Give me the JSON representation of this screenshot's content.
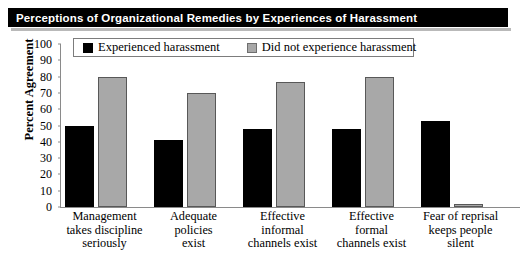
{
  "title": "Perceptions of Organizational Remedies by Experiences of Harassment",
  "axis_title": "Percent Agreement",
  "legend": {
    "entries": [
      {
        "label": "Experienced harassment",
        "color": "#000000",
        "swatch": "black"
      },
      {
        "label": "Did not experience harassment",
        "color": "#a8a8a8",
        "swatch": "gray"
      }
    ]
  },
  "y_ticks": [
    "100",
    "90",
    "80",
    "70",
    "60",
    "50",
    "40",
    "30",
    "20",
    "10",
    "0"
  ],
  "chart_data": {
    "type": "bar",
    "title": "Perceptions of Organizational Remedies by Experiences of Harassment",
    "xlabel": "",
    "ylabel": "Percent Agreement",
    "ylim": [
      0,
      100
    ],
    "ytick_step": 10,
    "grid": false,
    "legend_position": "top",
    "categories": [
      "Management takes discipline seriously",
      "Adequate policies exist",
      "Effective informal channels exist",
      "Effective formal channels exist",
      "Fear of reprisal keeps people silent"
    ],
    "category_lines": [
      [
        "Management",
        "takes discipline",
        "seriously"
      ],
      [
        "Adequate",
        "policies",
        "exist"
      ],
      [
        "Effective",
        "informal",
        "channels exist"
      ],
      [
        "Effective",
        "formal",
        "channels exist"
      ],
      [
        "Fear of reprisal",
        "keeps people",
        "silent"
      ]
    ],
    "series": [
      {
        "name": "Experienced harassment",
        "color": "#000000",
        "values": [
          50,
          41,
          48,
          48,
          53
        ]
      },
      {
        "name": "Did not experience harassment",
        "color": "#a8a8a8",
        "values": [
          80,
          70,
          77,
          80,
          2
        ]
      }
    ]
  }
}
